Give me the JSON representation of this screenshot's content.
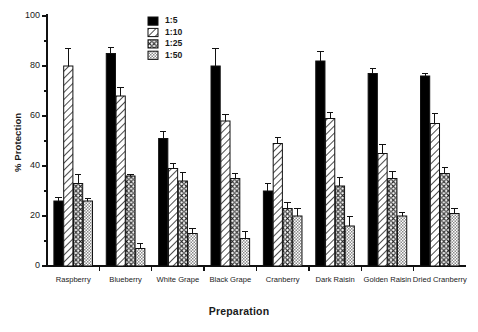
{
  "chart_data": {
    "type": "bar",
    "title": "",
    "xlabel": "Preparation",
    "ylabel": "% Protection",
    "ylim": [
      0,
      100
    ],
    "ytick_values": [
      0,
      20,
      40,
      60,
      80,
      100
    ],
    "ytick_labels": [
      "0",
      "20",
      "40",
      "60",
      "80",
      "100"
    ],
    "minor_tick_step": 10,
    "grid": false,
    "legend_position": "top-center",
    "error_bars": "upper-only (SEM)",
    "categories": [
      "Raspberry",
      "Blueberry",
      "White Grape",
      "Black Grape",
      "Cranberry",
      "Dark Raisin",
      "Golden Raisin",
      "Dried Cranberry"
    ],
    "series": [
      {
        "name": "1:5",
        "fill": "solid-black",
        "color": "#000000",
        "values": [
          26,
          85,
          51,
          80,
          30,
          82,
          77,
          76
        ],
        "errors": [
          1.5,
          2.5,
          3.0,
          7.0,
          3.0,
          4.0,
          2.0,
          1.0
        ]
      },
      {
        "name": "1:10",
        "fill": "diagonal-hatch",
        "color": "#ffffff",
        "values": [
          80,
          68,
          39,
          58,
          49,
          59,
          45,
          57
        ],
        "errors": [
          7.0,
          3.5,
          2.0,
          2.5,
          2.5,
          2.5,
          3.5,
          4.0
        ]
      },
      {
        "name": "1:25",
        "fill": "cross-hatch",
        "color": "#ffffff",
        "values": [
          33,
          36,
          34,
          35,
          23,
          32,
          35,
          37
        ],
        "errors": [
          3.5,
          0.8,
          3.5,
          2.0,
          2.5,
          3.5,
          3.0,
          2.5
        ]
      },
      {
        "name": "1:50",
        "fill": "fine-checker",
        "color": "#ffffff",
        "values": [
          26,
          7,
          13,
          11,
          20,
          16,
          20,
          21
        ],
        "errors": [
          1.0,
          2.0,
          2.0,
          3.0,
          3.0,
          4.0,
          1.5,
          2.0
        ]
      }
    ]
  },
  "axes": {
    "ylabel": "% Protection",
    "xlabel": "Preparation"
  },
  "legend": {
    "entries": [
      {
        "label": "1:5",
        "swatch": "solid-black-swatch"
      },
      {
        "label": "1:10",
        "swatch": "diagonal-hatch-swatch"
      },
      {
        "label": "1:25",
        "swatch": "cross-hatch-swatch"
      },
      {
        "label": "1:50",
        "swatch": "fine-checker-swatch"
      }
    ]
  }
}
